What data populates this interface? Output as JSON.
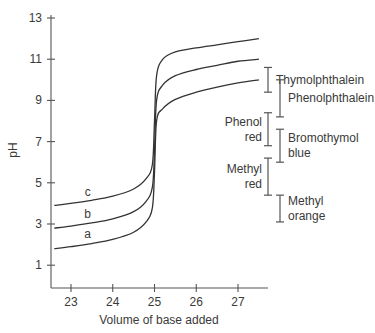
{
  "chart_data": {
    "type": "line",
    "title": "",
    "xlabel": "Volume of base added",
    "ylabel": "pH",
    "xlim": [
      22.55,
      27.7
    ],
    "ylim": [
      0,
      13.3
    ],
    "xticks": [
      23,
      24,
      25,
      26,
      27
    ],
    "yticks": [
      1,
      3,
      5,
      7,
      9,
      11,
      13
    ],
    "grid": false,
    "legend": "inline labels on curves",
    "series": [
      {
        "name": "a",
        "x": [
          22.6,
          23.0,
          23.5,
          24.0,
          24.5,
          24.8,
          24.95,
          25.0,
          25.05,
          25.2,
          25.5,
          26.0,
          26.5,
          27.0,
          27.5
        ],
        "y": [
          1.8,
          1.9,
          2.05,
          2.25,
          2.6,
          3.1,
          3.8,
          5.5,
          8.0,
          8.6,
          9.05,
          9.4,
          9.65,
          9.85,
          10.0
        ]
      },
      {
        "name": "b",
        "x": [
          22.6,
          23.0,
          23.5,
          24.0,
          24.5,
          24.8,
          24.95,
          25.0,
          25.05,
          25.2,
          25.5,
          26.0,
          26.5,
          27.0,
          27.5
        ],
        "y": [
          2.8,
          2.9,
          3.05,
          3.25,
          3.6,
          4.1,
          4.8,
          6.5,
          9.0,
          9.75,
          10.2,
          10.5,
          10.7,
          10.9,
          11.0
        ]
      },
      {
        "name": "c",
        "x": [
          22.6,
          23.0,
          23.5,
          24.0,
          24.5,
          24.8,
          24.95,
          25.0,
          25.05,
          25.2,
          25.5,
          26.0,
          26.5,
          27.0,
          27.5
        ],
        "y": [
          3.9,
          4.0,
          4.15,
          4.35,
          4.7,
          5.2,
          5.9,
          8.0,
          10.2,
          11.0,
          11.35,
          11.55,
          11.7,
          11.85,
          12.0
        ]
      }
    ],
    "curve_labels": [
      {
        "text": "a",
        "x": 23.4,
        "y": 2.3
      },
      {
        "text": "b",
        "x": 23.4,
        "y": 3.3
      },
      {
        "text": "c",
        "x": 23.4,
        "y": 4.35
      }
    ],
    "indicators": [
      {
        "name": "Thymolphthalein",
        "lines": [
          "Thymolphthalein"
        ],
        "range": [
          9.4,
          10.6
        ],
        "column": "left",
        "label_side": "right"
      },
      {
        "name": "Phenolphthalein",
        "lines": [
          "Phenolphthalein"
        ],
        "range": [
          8.2,
          10.0
        ],
        "column": "right",
        "label_side": "right"
      },
      {
        "name": "Phenol red",
        "lines": [
          "Phenol",
          "red"
        ],
        "range": [
          6.8,
          8.4
        ],
        "column": "left",
        "label_side": "left"
      },
      {
        "name": "Bromothymol blue",
        "lines": [
          "Bromothymol",
          "blue"
        ],
        "range": [
          6.0,
          7.6
        ],
        "column": "right",
        "label_side": "right"
      },
      {
        "name": "Methyl red",
        "lines": [
          "Methyl",
          "red"
        ],
        "range": [
          4.4,
          6.2
        ],
        "column": "left",
        "label_side": "left"
      },
      {
        "name": "Methyl orange",
        "lines": [
          "Methyl",
          "orange"
        ],
        "range": [
          3.1,
          4.4
        ],
        "column": "right",
        "label_side": "right"
      }
    ]
  }
}
